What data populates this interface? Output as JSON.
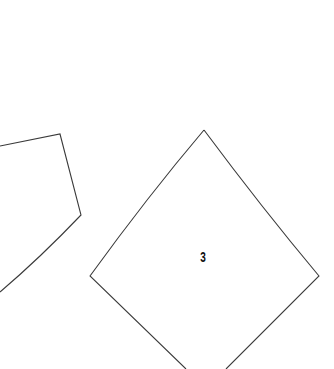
{
  "canvas": {
    "width": 334,
    "height": 369,
    "background": "#ffffff",
    "stroke_color": "#3a3a3a",
    "label_color": "#111111"
  },
  "pieces": [
    {
      "id": "left-piece",
      "label": "",
      "partially_visible": true,
      "path": "M0,146 L60,134 L81,215 Q40,258 0,292"
    },
    {
      "id": "piece-3",
      "label": "3",
      "partially_visible": true,
      "path": "M204,130 Q148,196 90,276 L186,369 M226,369 L319,276 Q262,208 204,130",
      "label_position": {
        "x": 203,
        "y": 257
      }
    }
  ]
}
